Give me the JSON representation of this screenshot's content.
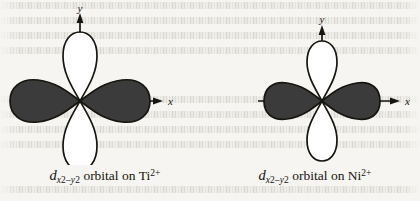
{
  "figure": {
    "background_color": "#f6f5f1",
    "ink_color": "#17150f",
    "lobe_fill_color": "#3b3b3b",
    "lobe_empty_color": "#ffffff",
    "diagrams": [
      {
        "id": "ti",
        "orbital_type": "d_x2-y2",
        "ion": "Ti2+",
        "axis_x_label": "x",
        "axis_y_label": "y",
        "lobe_count": 4,
        "filled_lobes": [
          "+x",
          "-x"
        ],
        "empty_lobes": [
          "+y",
          "-y"
        ],
        "caption": {
          "symbol": "d",
          "subscript": "x2−y2",
          "sub_part_1": "x",
          "sub_part_1_exp": "2",
          "sub_minus": "–",
          "sub_part_2": "y",
          "sub_part_2_exp": "2",
          "middle": " orbital on ",
          "element": "Ti",
          "charge": "2+"
        }
      },
      {
        "id": "ni",
        "orbital_type": "d_x2-y2",
        "ion": "Ni2+",
        "axis_x_label": "x",
        "axis_y_label": "y",
        "lobe_count": 4,
        "filled_lobes": [
          "+x",
          "-x"
        ],
        "empty_lobes": [
          "+y",
          "-y"
        ],
        "caption": {
          "symbol": "d",
          "subscript": "x2−y2",
          "sub_part_1": "x",
          "sub_part_1_exp": "2",
          "sub_minus": "–",
          "sub_part_2": "y",
          "sub_part_2_exp": "2",
          "middle": " orbital on ",
          "element": "Ni",
          "charge": "2+"
        }
      }
    ]
  }
}
